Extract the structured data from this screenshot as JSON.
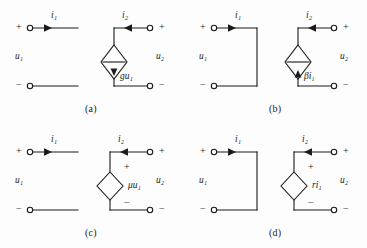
{
  "figure": {
    "background_color": "#fdfdfd",
    "line_color": "#1b1b1b",
    "terminal_style": "open-circle",
    "width": 367,
    "height": 248
  },
  "symbols": {
    "plus": "+",
    "minus": "−",
    "i1": "i",
    "i1_sub": "1",
    "i2": "i",
    "i2_sub": "2",
    "u1": "u",
    "u1_sub": "1",
    "u2": "u",
    "u2_sub": "2"
  },
  "circuits": [
    {
      "id": "a",
      "caption": "(a)",
      "type": "voltage-controlled-current-source",
      "source_shape": "diamond-current-source",
      "source_label_main": "g",
      "source_label_var": "u",
      "source_label_sub": "1",
      "source_label_full": "gu₁",
      "input_port": "open",
      "arrow_direction": "down",
      "left_plus": "+",
      "left_minus": "−",
      "right_plus": "+",
      "right_minus": "−",
      "current_in_label": "i₁",
      "current_out_label": "i₂",
      "voltage_in_label": "u₁",
      "voltage_out_label": "u₂",
      "current_in_dir": "right",
      "current_out_dir": "left"
    },
    {
      "id": "b",
      "caption": "(b)",
      "type": "current-controlled-current-source",
      "source_shape": "diamond-current-source",
      "source_label_main": "β",
      "source_label_var": "i",
      "source_label_sub": "1",
      "source_label_full": "βi₁",
      "input_port": "short",
      "arrow_direction": "up",
      "left_plus": "+",
      "left_minus": "−",
      "right_plus": "+",
      "right_minus": "−",
      "current_in_label": "i₁",
      "current_out_label": "i₂",
      "voltage_in_label": "u₁",
      "voltage_out_label": "u₂",
      "current_in_dir": "right",
      "current_out_dir": "left"
    },
    {
      "id": "c",
      "caption": "(c)",
      "type": "voltage-controlled-voltage-source",
      "source_shape": "diamond-voltage-source",
      "source_label_main": "μ",
      "source_label_var": "u",
      "source_label_sub": "1",
      "source_label_full": "μu₁",
      "input_port": "open",
      "source_plus": "+",
      "source_minus": "−",
      "left_plus": "+",
      "left_minus": "−",
      "right_plus": "+",
      "right_minus": "−",
      "current_in_label": "i₁",
      "current_out_label": "i₂",
      "voltage_in_label": "u₁",
      "voltage_out_label": "u₂",
      "current_in_dir": "right",
      "current_out_dir": "left"
    },
    {
      "id": "d",
      "caption": "(d)",
      "type": "current-controlled-voltage-source",
      "source_shape": "diamond-voltage-source",
      "source_label_main": "r",
      "source_label_var": "i",
      "source_label_sub": "1",
      "source_label_full": "ri₁",
      "input_port": "short",
      "source_plus": "+",
      "source_minus": "−",
      "left_plus": "+",
      "left_minus": "−",
      "right_plus": "+",
      "right_minus": "−",
      "current_in_label": "i₁",
      "current_out_label": "i₂",
      "voltage_in_label": "u₁",
      "voltage_out_label": "u₂",
      "current_in_dir": "right",
      "current_out_dir": "left"
    }
  ]
}
